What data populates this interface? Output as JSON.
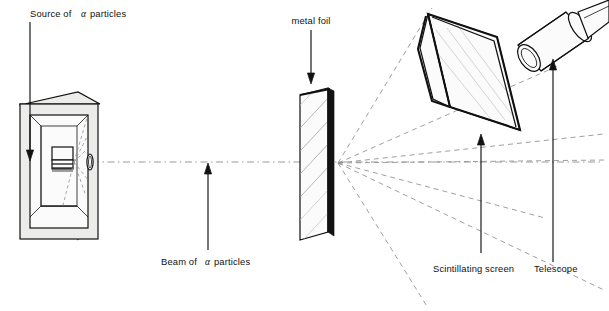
{
  "figure": {
    "background_color": "#ffffff",
    "ink_color": "#111111",
    "ray_color": "#8e8e8e",
    "width": 609,
    "height": 311
  },
  "labels": {
    "source": {
      "text_before": "Source of",
      "greek": "α",
      "text_after": "particles",
      "full": "Source of α particles"
    },
    "beam": {
      "text_before": "Beam of",
      "greek": "α",
      "text_after": "particles",
      "full": "Beam of α particles"
    },
    "foil": {
      "full": "metal foil"
    },
    "screen": {
      "full": "Scintillating screen"
    },
    "telescope": {
      "full": "Telescope"
    }
  },
  "components": [
    {
      "name": "lead-source-box",
      "label": "Source of α particles",
      "description": "Shaded three dimensional lead container with hollow cavity, cylindrical alpha source inside and a narrow exit slit in the right wall"
    },
    {
      "name": "metal-foil",
      "label": "metal foil",
      "description": "Thin hatched foil sheet standing on the beam axis, drawn as a slanted parallelogram slab"
    },
    {
      "name": "scintillating-screen",
      "label": "Scintillating screen",
      "description": "Tilted rectangular zinc sulphide screen mounted above and to the right of the foil"
    },
    {
      "name": "telescope",
      "label": "Telescope",
      "description": "Cylindrical viewing telescope with eyepiece ring and mounting rod, aimed at the scintillating screen"
    },
    {
      "name": "beam-axis",
      "label": "Beam of α particles",
      "description": "Horizontal dash dot centre line running from the source slit through the foil and off to the right"
    },
    {
      "name": "scattered-rays",
      "description": "Fan of dashed lines radiating from the foil showing alpha particles deflected through a range of scattering angles"
    }
  ],
  "geometry": {
    "beam_axis_y": 162,
    "foil_center_x": 316,
    "scatter_origin": {
      "x": 338,
      "y": 163
    },
    "source_slit": {
      "x": 92,
      "y": 162
    }
  }
}
